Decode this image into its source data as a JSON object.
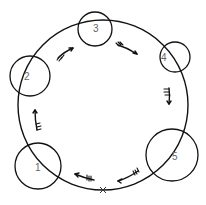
{
  "diagram": {
    "type": "circular-route",
    "ring": {
      "cx": 103,
      "cy": 105,
      "r": 85
    },
    "stops": [
      {
        "label": "1",
        "cx": 38,
        "cy": 166,
        "r": 23
      },
      {
        "label": "2",
        "cx": 30,
        "cy": 76,
        "r": 20
      },
      {
        "label": "3",
        "cx": 95,
        "cy": 29,
        "r": 17
      },
      {
        "label": "4",
        "cx": 175,
        "cy": 57,
        "r": 15
      },
      {
        "label": "5",
        "cx": 172,
        "cy": 155,
        "r": 26
      }
    ],
    "start_marker": {
      "label": "X",
      "x": 103,
      "y": 190
    },
    "direction": "clockwise"
  }
}
